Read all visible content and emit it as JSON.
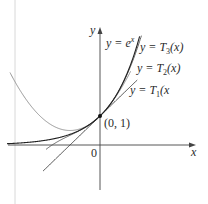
{
  "figure": {
    "origin_label": "0",
    "x_axis_label": "x",
    "y_axis_label": "y",
    "point_label": "(0, 1)",
    "curve_labels": {
      "exp": "y = e^x",
      "t3": "y = T₃(x)",
      "t2": "y = T₂(x)",
      "t1": "y = T₁(x"
    },
    "colors": {
      "axis": "#444444",
      "exp": "#222222",
      "t3": "#555555",
      "t2": "#888888",
      "t1": "#333333",
      "margin_line": "#d0d0d0"
    }
  },
  "chart_data": {
    "type": "line",
    "title": "",
    "xlabel": "x",
    "ylabel": "y",
    "xlim": [
      -3.1,
      3.2
    ],
    "ylim": [
      -1.5,
      4.1
    ],
    "annotations": [
      {
        "label": "(0, 1)",
        "x": 0,
        "y": 1
      }
    ],
    "series": [
      {
        "name": "y = e^x",
        "formula": "e^x"
      },
      {
        "name": "y = T3(x)",
        "formula": "1 + x + x^2/2 + x^3/6"
      },
      {
        "name": "y = T2(x)",
        "formula": "1 + x + x^2/2"
      },
      {
        "name": "y = T1(x)",
        "formula": "1 + x"
      }
    ]
  }
}
